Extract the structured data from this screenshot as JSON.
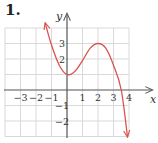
{
  "problem_number": "1.",
  "chart_data": {
    "type": "line",
    "title": "",
    "xlabel": "x",
    "ylabel": "y",
    "xlim": [
      -4,
      4
    ],
    "ylim": [
      -3,
      4
    ],
    "grid": true,
    "x_tick_labels": [
      "−3",
      "−2",
      "−1",
      "1",
      "2",
      "3",
      "4"
    ],
    "x_ticks": [
      -3,
      -2,
      -1,
      1,
      2,
      3,
      4
    ],
    "y_tick_labels": [
      "3",
      "2",
      "−1",
      "−2"
    ],
    "y_ticks": [
      3,
      2,
      -1,
      -2
    ],
    "series": [
      {
        "name": "f(x)",
        "color": "#d9534f",
        "description": "cubic-like curve with arrows at both ends; local min (0,1), local max (2,3), x-intercept near 3.5",
        "x": [
          -1.4,
          -1,
          -0.5,
          0,
          0.5,
          1,
          1.5,
          2,
          2.5,
          3,
          3.5,
          3.9
        ],
        "y": [
          4.3,
          2.9,
          1.6,
          1.0,
          1.2,
          1.9,
          2.7,
          3.0,
          2.7,
          1.6,
          0.0,
          -3.0
        ]
      }
    ]
  }
}
